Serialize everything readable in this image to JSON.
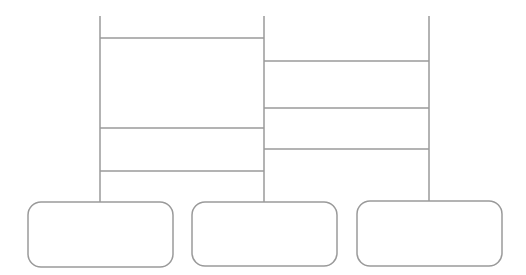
{
  "diagram": {
    "type": "ladder",
    "line_color": "#9a9a9a",
    "verticals": [
      {
        "x": 100,
        "y1": 16,
        "y2": 202
      },
      {
        "x": 264,
        "y1": 16,
        "y2": 202
      },
      {
        "x": 429,
        "y1": 16,
        "y2": 201
      }
    ],
    "rungs": [
      {
        "x1": 100,
        "x2": 264,
        "y": 38
      },
      {
        "x1": 100,
        "x2": 264,
        "y": 128
      },
      {
        "x1": 100,
        "x2": 264,
        "y": 171
      },
      {
        "x1": 264,
        "x2": 429,
        "y": 61
      },
      {
        "x1": 264,
        "x2": 429,
        "y": 108
      },
      {
        "x1": 264,
        "x2": 429,
        "y": 149
      }
    ],
    "boxes": [
      {
        "x": 28,
        "y": 202,
        "w": 145,
        "h": 65,
        "label": ""
      },
      {
        "x": 192,
        "y": 202,
        "w": 145,
        "h": 64,
        "label": ""
      },
      {
        "x": 357,
        "y": 201,
        "w": 145,
        "h": 65,
        "label": ""
      }
    ]
  }
}
